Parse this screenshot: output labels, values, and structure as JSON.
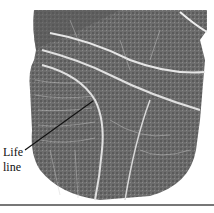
{
  "figure": {
    "annotation": {
      "line1": "Life",
      "line2": "line"
    }
  }
}
